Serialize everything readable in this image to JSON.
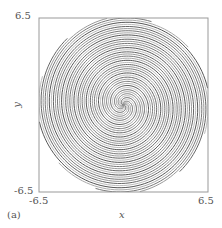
{
  "panel_label": "(a)",
  "chart_data": {
    "type": "line",
    "title": "",
    "xlabel": "x",
    "ylabel": "y",
    "xlim": [
      -6.5,
      6.5
    ],
    "ylim": [
      -6.5,
      6.5
    ],
    "x_ticks": [
      "-6.5",
      "6.5"
    ],
    "y_ticks": [
      "-6.5",
      "6.5"
    ],
    "grid": false,
    "legend": null,
    "series": [
      {
        "name": "arm-1a",
        "color": "#555555",
        "phase_deg": 0
      },
      {
        "name": "arm-1b",
        "color": "#aaaaaa",
        "phase_deg": 30
      },
      {
        "name": "arm-1c",
        "color": "#777777",
        "phase_deg": 60
      },
      {
        "name": "arm-1d",
        "color": "#999999",
        "phase_deg": 90
      },
      {
        "name": "arm-1e",
        "color": "#666666",
        "phase_deg": 120
      },
      {
        "name": "arm-1f",
        "color": "#bbbbbb",
        "phase_deg": 150
      },
      {
        "name": "arm-2a",
        "color": "#555555",
        "phase_deg": 180
      },
      {
        "name": "arm-2b",
        "color": "#aaaaaa",
        "phase_deg": 210
      },
      {
        "name": "arm-2c",
        "color": "#777777",
        "phase_deg": 240
      },
      {
        "name": "arm-2d",
        "color": "#999999",
        "phase_deg": 270
      },
      {
        "name": "arm-2e",
        "color": "#666666",
        "phase_deg": 300
      },
      {
        "name": "arm-2f",
        "color": "#bbbbbb",
        "phase_deg": 330
      }
    ],
    "spiral": {
      "pitch_per_turn": 1.9,
      "max_radius": 6.6
    },
    "frame_color": "#999999"
  }
}
